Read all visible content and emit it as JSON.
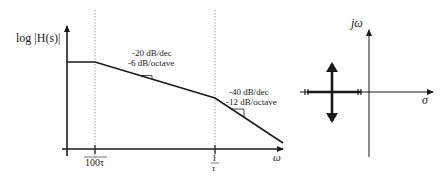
{
  "bode": {
    "ylabel": "log |H(s)|",
    "xlabel": "ω",
    "tick_left": "100τ",
    "tick_right_num": "1",
    "tick_right_den": "τ",
    "slope1_line1": "-20 dB/dec",
    "slope1_line2": "-6 dB/octave",
    "slope2_line1": "-40 dB/dec",
    "slope2_line2": "-12 dB/octave"
  },
  "pz": {
    "imag_axis_label": "jω",
    "real_axis_label": "σ"
  },
  "colors": {
    "line": "#1a1a1a",
    "grid": "#888888"
  }
}
